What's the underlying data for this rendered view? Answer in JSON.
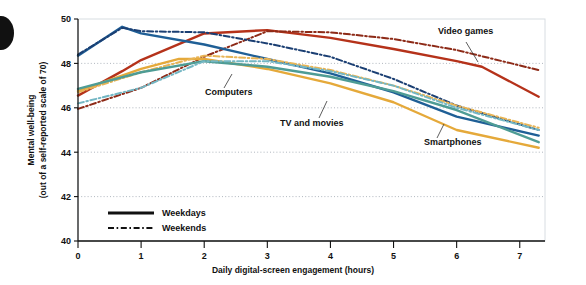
{
  "chart_data": {
    "type": "line",
    "title": "",
    "xlabel": "Daily digital-screen engagement (hours)",
    "ylabel": "Mental well-being\n(out of a self-reported scale of 70)",
    "ylabel_line1": "Mental well-being",
    "ylabel_line2": "(out of a self-reported scale of 70)",
    "xlim": [
      0,
      7.4
    ],
    "ylim": [
      40,
      50
    ],
    "xticks": [
      0,
      1,
      2,
      3,
      4,
      5,
      6,
      7
    ],
    "xticklabels": [
      "0",
      "1",
      "2",
      "3",
      "4",
      "5",
      "6",
      "7"
    ],
    "yticks": [
      40,
      42,
      44,
      46,
      48,
      50
    ],
    "yticklabels": [
      "40",
      "42",
      "44",
      "46",
      "48",
      "50"
    ],
    "grid": "horizontal-dotted",
    "legend_position": "bottom-left-inside",
    "legend": [
      {
        "label": "Weekdays",
        "style": "solid"
      },
      {
        "label": "Weekends",
        "style": "dash-dot"
      }
    ],
    "annotations": [
      {
        "text": "Computers",
        "x_px": 205,
        "y_px": 95
      },
      {
        "text": "TV and movies",
        "x_px": 280,
        "y_px": 126
      },
      {
        "text": "Smartphones",
        "x_px": 424,
        "y_px": 145
      },
      {
        "text": "Video games",
        "x_px": 438,
        "y_px": 34
      }
    ],
    "series": [
      {
        "name": "Video games",
        "daypart": "Weekdays",
        "style": "solid",
        "color": "#b5321a",
        "x": [
          0,
          0.7,
          1,
          2,
          3,
          4,
          5,
          6,
          6.4,
          7.3
        ],
        "y": [
          46.55,
          47.65,
          48.15,
          49.35,
          49.5,
          49.15,
          48.65,
          48.1,
          47.85,
          46.5
        ]
      },
      {
        "name": "Video games",
        "daypart": "Weekends",
        "style": "dash-dot",
        "color": "#8d2a17",
        "x": [
          0,
          1,
          2,
          3,
          4,
          5,
          6,
          7.3
        ],
        "y": [
          45.95,
          46.9,
          48.3,
          49.45,
          49.4,
          49.1,
          48.6,
          47.7
        ]
      },
      {
        "name": "Smartphones",
        "daypart": "Weekdays",
        "style": "solid",
        "color": "#1f5f96",
        "x": [
          0,
          0.7,
          1,
          2,
          3,
          4,
          5,
          6,
          7.3
        ],
        "y": [
          48.35,
          49.65,
          49.35,
          48.85,
          48.2,
          47.55,
          46.7,
          45.6,
          44.75
        ]
      },
      {
        "name": "Smartphones",
        "daypart": "Weekends",
        "style": "dash-dot",
        "color": "#1b3f73",
        "x": [
          0,
          0.7,
          1,
          2,
          3,
          4,
          5,
          6,
          7.3
        ],
        "y": [
          48.4,
          49.6,
          49.45,
          49.4,
          48.9,
          48.3,
          47.3,
          46.1,
          45.0
        ]
      },
      {
        "name": "Computers",
        "daypart": "Weekdays",
        "style": "solid",
        "color": "#e5a93a",
        "x": [
          0,
          1,
          1.6,
          2,
          3,
          4,
          5,
          6,
          7.3
        ],
        "y": [
          46.75,
          47.75,
          48.2,
          48.2,
          47.75,
          47.1,
          46.25,
          45.0,
          44.2
        ]
      },
      {
        "name": "Computers",
        "daypart": "Weekends",
        "style": "dash-dot",
        "color": "#e8b455",
        "x": [
          0,
          1,
          2,
          3,
          4,
          5,
          6,
          7.3
        ],
        "y": [
          46.7,
          47.6,
          48.35,
          48.2,
          47.7,
          47.0,
          46.1,
          45.1
        ]
      },
      {
        "name": "TV and movies",
        "daypart": "Weekdays",
        "style": "solid",
        "color": "#4e9c95",
        "x": [
          0,
          1,
          2,
          3,
          4,
          5,
          6,
          7.3
        ],
        "y": [
          46.85,
          47.6,
          48.1,
          47.85,
          47.4,
          46.75,
          45.9,
          44.45
        ]
      },
      {
        "name": "TV and movies",
        "daypart": "Weekends",
        "style": "dash-dot",
        "color": "#74b7c4",
        "x": [
          0,
          1,
          2,
          3,
          4,
          5,
          6,
          7.3
        ],
        "y": [
          46.2,
          46.9,
          48.1,
          48.1,
          47.65,
          47.0,
          46.0,
          45.0
        ]
      }
    ]
  },
  "colors": {
    "video_games": "#b5321a",
    "smartphones": "#1f5f96",
    "computers": "#e5a93a",
    "tv_and_movies": "#4e9c95",
    "axis": "#111111",
    "grid": "#9aa3ad",
    "plot_background": "#ffffff"
  }
}
